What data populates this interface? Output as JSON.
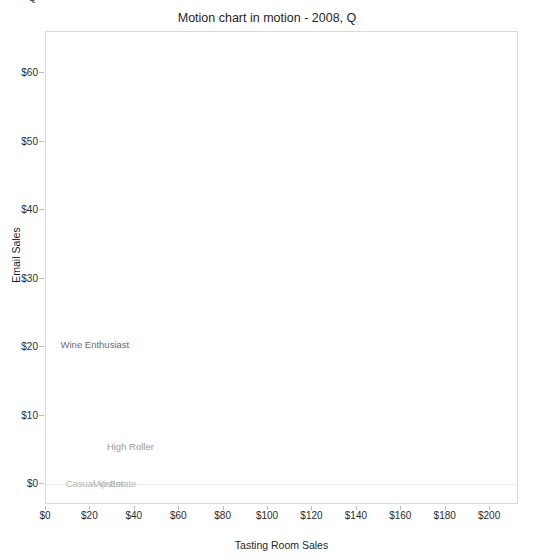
{
  "clipped_fragment": "Q",
  "chart_data": {
    "type": "scatter",
    "title": "Motion chart in motion - 2008, Q",
    "xlabel": "Tasting Room Sales",
    "ylabel": "Email Sales",
    "xlim": [
      0,
      213
    ],
    "ylim": [
      -3,
      66
    ],
    "grid": false,
    "baseline_y": 0,
    "legend": "none",
    "x_tick_labels": [
      "$0",
      "$20",
      "$40",
      "$60",
      "$80",
      "$100",
      "$120",
      "$140",
      "$160",
      "$180",
      "$200"
    ],
    "x_tick_values": [
      0,
      20,
      40,
      60,
      80,
      100,
      120,
      140,
      160,
      180,
      200
    ],
    "y_tick_labels": [
      "$0",
      "$10",
      "$20",
      "$30",
      "$40",
      "$50",
      "$60"
    ],
    "y_tick_values": [
      0,
      10,
      20,
      30,
      40,
      50,
      60
    ],
    "points": [
      {
        "label": "Wine Enthusiast",
        "x": 22,
        "y": 20.5,
        "color": "#6b6b6b"
      },
      {
        "label": "High Roller",
        "x": 38,
        "y": 5.6,
        "color": "#9a9a9a"
      },
      {
        "label": "Casual Visitor",
        "x": 22,
        "y": 0.2,
        "color": "#b2b2b2"
      },
      {
        "label": "Vip Estate",
        "x": 31,
        "y": 0.2,
        "color": "#b8b8b8"
      }
    ]
  },
  "colors": {
    "plot_border": "#d9d9d9",
    "gridline": "#ededed",
    "tick": "#bdbdbd",
    "text": "#1f1f1f",
    "background": "#ffffff"
  }
}
